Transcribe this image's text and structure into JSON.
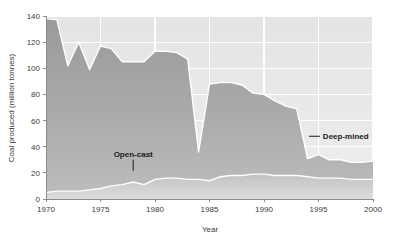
{
  "chart_data": {
    "type": "area",
    "stacked": true,
    "title": "",
    "xlabel": "Year",
    "ylabel": "Coal produced (million tonnes)",
    "xlim": [
      1970,
      2000
    ],
    "ylim": [
      0,
      140
    ],
    "xticks": [
      1970,
      1975,
      1980,
      1985,
      1990,
      1995,
      2000
    ],
    "yticks": [
      0,
      20,
      40,
      60,
      80,
      100,
      120,
      140
    ],
    "grid": true,
    "legend": "annotations",
    "x": [
      1970,
      1971,
      1972,
      1973,
      1974,
      1975,
      1976,
      1977,
      1978,
      1979,
      1980,
      1981,
      1982,
      1983,
      1984,
      1985,
      1986,
      1987,
      1988,
      1989,
      1990,
      1991,
      1992,
      1993,
      1994,
      1995,
      1996,
      1997,
      1998,
      1999,
      2000
    ],
    "series": [
      {
        "name": "Open-cast",
        "color": "#c8c8c8",
        "values": [
          5,
          6,
          6,
          6,
          7,
          8,
          10,
          11,
          13,
          11,
          15,
          16,
          16,
          15,
          15,
          14,
          17,
          18,
          18,
          19,
          19,
          18,
          18,
          18,
          17,
          16,
          16,
          16,
          15,
          15,
          15
        ]
      },
      {
        "name": "Deep-mined",
        "color": "#a6a6a6",
        "values": [
          133,
          131,
          96,
          114,
          92,
          109,
          105,
          94,
          92,
          94,
          98,
          97,
          96,
          92,
          21,
          74,
          72,
          71,
          69,
          62,
          61,
          57,
          53,
          51,
          14,
          18,
          14,
          14,
          13,
          13,
          14
        ]
      }
    ],
    "totals": [
      138,
      137,
      102,
      120,
      99,
      117,
      115,
      105,
      105,
      105,
      113,
      113,
      112,
      107,
      36,
      88,
      89,
      89,
      87,
      81,
      80,
      75,
      71,
      69,
      31,
      34,
      30,
      30,
      28,
      28,
      29
    ],
    "annotations": [
      {
        "label": "Open-cast",
        "x": 1978,
        "y": 24
      },
      {
        "label": "Deep-mined",
        "x": 1995.4,
        "y": 48
      }
    ]
  },
  "axes": {
    "y_title": "Coal produced (million tonnes)",
    "x_title": "Year",
    "y_tick_labels": [
      "0",
      "20",
      "40",
      "60",
      "80",
      "100",
      "120",
      "140"
    ],
    "x_tick_labels": [
      "1970",
      "1975",
      "1980",
      "1985",
      "1990",
      "1995",
      "2000"
    ]
  },
  "colors": {
    "plot_background": "#e7e7e7",
    "gridline": "#ffffff",
    "axis_line": "#8a8a8a",
    "deep_mined": "#a6a6a6",
    "open_cast": "#c9c9c9",
    "text": "#3a3a3a",
    "annotation_text": "#1a1a1a"
  }
}
